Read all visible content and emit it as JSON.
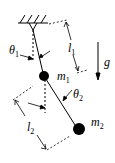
{
  "diagram": {
    "labels": {
      "theta1": "θ",
      "theta1_sub": "1",
      "theta2": "θ",
      "theta2_sub": "2",
      "l1": "l",
      "l1_sub": "1",
      "l2": "l",
      "l2_sub": "2",
      "m1": "m",
      "m1_sub": "1",
      "m2": "m",
      "m2_sub": "2",
      "g": "g"
    },
    "colors": {
      "ink": "#000000",
      "background": "#ffffff"
    }
  }
}
